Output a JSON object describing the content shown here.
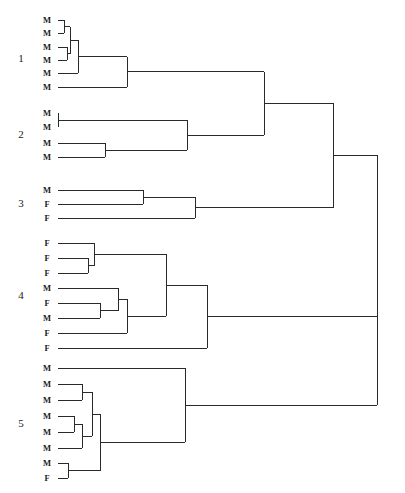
{
  "figure": {
    "type": "dendrogram",
    "width": 405,
    "height": 493,
    "background_color": "#ffffff",
    "line_color": "#2a2a2a",
    "line_width": 1,
    "orientation": "horizontal-left-to-right"
  },
  "chart_data": {
    "type": "dendrogram",
    "title": "",
    "xlabel": "",
    "ylabel": "",
    "leaf_label_values": [
      "M",
      "F"
    ],
    "cluster_count": 5,
    "leaf_count": 29,
    "clusters": [
      {
        "id": "1",
        "label": "1",
        "label_x": 21,
        "label_y": 59,
        "leaves": [
          {
            "label": "M",
            "x": 47,
            "y": 20
          },
          {
            "label": "M",
            "x": 47,
            "y": 33
          },
          {
            "label": "M",
            "x": 47,
            "y": 47
          },
          {
            "label": "M",
            "x": 47,
            "y": 60
          },
          {
            "label": "M",
            "x": 47,
            "y": 73
          },
          {
            "label": "M",
            "x": 47,
            "y": 87
          }
        ]
      },
      {
        "id": "2",
        "label": "2",
        "label_x": 21,
        "label_y": 135,
        "leaves": [
          {
            "label": "M",
            "x": 47,
            "y": 113
          },
          {
            "label": "M",
            "x": 47,
            "y": 127
          },
          {
            "label": "M",
            "x": 47,
            "y": 143
          },
          {
            "label": "M",
            "x": 47,
            "y": 157
          }
        ]
      },
      {
        "id": "3",
        "label": "3",
        "label_x": 21,
        "label_y": 204,
        "leaves": [
          {
            "label": "M",
            "x": 47,
            "y": 190
          },
          {
            "label": "F",
            "x": 47,
            "y": 204
          },
          {
            "label": "F",
            "x": 47,
            "y": 218
          }
        ]
      },
      {
        "id": "4",
        "label": "4",
        "label_x": 21,
        "label_y": 296,
        "leaves": [
          {
            "label": "F",
            "x": 47,
            "y": 243
          },
          {
            "label": "F",
            "x": 47,
            "y": 258
          },
          {
            "label": "F",
            "x": 47,
            "y": 273
          },
          {
            "label": "M",
            "x": 47,
            "y": 288
          },
          {
            "label": "F",
            "x": 47,
            "y": 303
          },
          {
            "label": "M",
            "x": 47,
            "y": 318
          },
          {
            "label": "F",
            "x": 47,
            "y": 333
          },
          {
            "label": "F",
            "x": 47,
            "y": 348
          }
        ]
      },
      {
        "id": "5",
        "label": "5",
        "label_x": 21,
        "label_y": 424,
        "leaves": [
          {
            "label": "M",
            "x": 47,
            "y": 368
          },
          {
            "label": "M",
            "x": 47,
            "y": 384
          },
          {
            "label": "M",
            "x": 47,
            "y": 400
          },
          {
            "label": "M",
            "x": 47,
            "y": 416
          },
          {
            "label": "M",
            "x": 47,
            "y": 432
          },
          {
            "label": "M",
            "x": 47,
            "y": 448
          },
          {
            "label": "M",
            "x": 47,
            "y": 463
          },
          {
            "label": "F",
            "x": 47,
            "y": 478
          }
        ]
      }
    ],
    "leaf_start_x": 58,
    "merges": [
      {
        "name": "c1-n1",
        "x": 64,
        "y_top": 20,
        "y_bot": 33,
        "y_mid": 26.5
      },
      {
        "name": "c1-n2",
        "x": 67,
        "y_top": 47,
        "y_bot": 60,
        "y_mid": 53.5
      },
      {
        "name": "c1-n3",
        "x": 70,
        "y_top": 26.5,
        "y_bot": 53.5,
        "y_mid": 40
      },
      {
        "name": "c1-n4",
        "x": 78,
        "y_top": 40,
        "y_bot": 73,
        "y_mid": 56.5
      },
      {
        "name": "c1-n5",
        "x": 127,
        "y_top": 56.5,
        "y_bot": 87,
        "y_mid": 71.7
      },
      {
        "name": "c2-n1",
        "x": 105,
        "y_top": 143,
        "y_bot": 157,
        "y_mid": 150
      },
      {
        "name": "c2-n2",
        "x": 187,
        "y_top": 120,
        "y_bot": 150,
        "y_mid": 135
      },
      {
        "name": "c2-p",
        "x": 58,
        "y_top": 113,
        "y_bot": 127,
        "y_mid": 120
      },
      {
        "name": "c3-n1",
        "x": 143,
        "y_top": 190,
        "y_bot": 204,
        "y_mid": 197
      },
      {
        "name": "c3-n2",
        "x": 195,
        "y_top": 197,
        "y_bot": 218,
        "y_mid": 207.5
      },
      {
        "name": "c4-n1",
        "x": 88,
        "y_top": 258,
        "y_bot": 273,
        "y_mid": 265.5
      },
      {
        "name": "c4-n2",
        "x": 94,
        "y_top": 243,
        "y_bot": 265.5,
        "y_mid": 254
      },
      {
        "name": "c4-n3",
        "x": 100,
        "y_top": 303,
        "y_bot": 318,
        "y_mid": 310.5
      },
      {
        "name": "c4-n4",
        "x": 118,
        "y_top": 288,
        "y_bot": 310.5,
        "y_mid": 299
      },
      {
        "name": "c4-n5",
        "x": 127,
        "y_top": 299,
        "y_bot": 333,
        "y_mid": 316
      },
      {
        "name": "c4-n6",
        "x": 166,
        "y_top": 254,
        "y_bot": 316,
        "y_mid": 285
      },
      {
        "name": "c4-n7",
        "x": 207,
        "y_top": 285,
        "y_bot": 348,
        "y_mid": 316.5
      },
      {
        "name": "c5-n1",
        "x": 82,
        "y_top": 384,
        "y_bot": 400,
        "y_mid": 392
      },
      {
        "name": "c5-n2",
        "x": 74,
        "y_top": 416,
        "y_bot": 432,
        "y_mid": 424
      },
      {
        "name": "c5-n3",
        "x": 82,
        "y_top": 424,
        "y_bot": 448,
        "y_mid": 436
      },
      {
        "name": "c5-n4",
        "x": 92,
        "y_top": 392,
        "y_bot": 436,
        "y_mid": 414
      },
      {
        "name": "c5-n5",
        "x": 68,
        "y_top": 463,
        "y_bot": 478,
        "y_mid": 470.5
      },
      {
        "name": "c5-n6",
        "x": 100,
        "y_top": 414,
        "y_bot": 470.5,
        "y_mid": 442
      },
      {
        "name": "c5-n7",
        "x": 185,
        "y_top": 368,
        "y_bot": 442,
        "y_mid": 405
      },
      {
        "name": "m-12",
        "x": 264,
        "y_top": 71.7,
        "y_bot": 135,
        "y_mid": 103
      },
      {
        "name": "m-123",
        "x": 333,
        "y_top": 103,
        "y_bot": 207.5,
        "y_mid": 155
      },
      {
        "name": "m-1234",
        "x": 377,
        "y_top": 155,
        "y_bot": 316.5,
        "y_mid": 236
      },
      {
        "name": "root",
        "x": 377,
        "y_top": 236,
        "y_bot": 405,
        "y_mid": 320
      }
    ]
  }
}
